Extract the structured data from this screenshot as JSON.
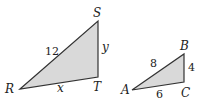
{
  "colors": {
    "fill": "#d9d9d9",
    "stroke": "#333333"
  },
  "triangles": [
    {
      "name": "RST",
      "vertices": {
        "R": "R",
        "S": "S",
        "T": "T"
      },
      "sides": {
        "RS": "12",
        "ST": "y",
        "RT": "x"
      }
    },
    {
      "name": "ABC",
      "vertices": {
        "A": "A",
        "B": "B",
        "C": "C"
      },
      "sides": {
        "AB": "8",
        "BC": "4",
        "AC": "6"
      }
    }
  ]
}
